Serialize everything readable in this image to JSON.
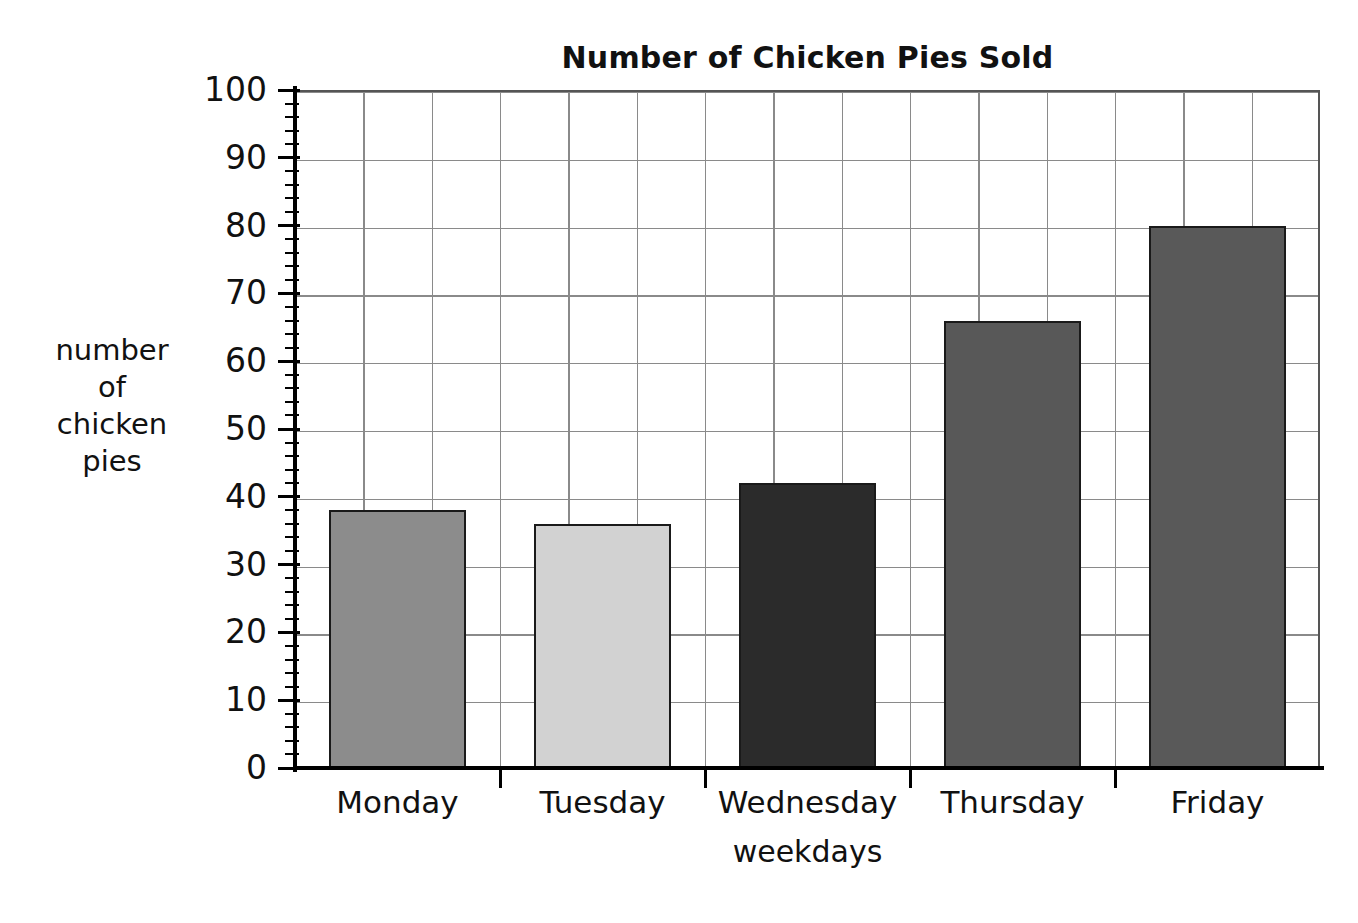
{
  "chart_data": {
    "type": "bar",
    "title": "Number of Chicken Pies Sold",
    "xlabel": "weekdays",
    "ylabel": "number of chicken pies",
    "categories": [
      "Monday",
      "Tuesday",
      "Wednesday",
      "Thursday",
      "Friday"
    ],
    "values": [
      38,
      36,
      42,
      66,
      80
    ],
    "bar_colors": [
      "#8c8c8c",
      "#d2d2d2",
      "#2b2b2b",
      "#585858",
      "#595959"
    ],
    "ylim": [
      0,
      100
    ],
    "ytick_major_step": 10,
    "ytick_minor_step": 2,
    "ytick_labels": [
      "0",
      "10",
      "20",
      "30",
      "40",
      "50",
      "60",
      "70",
      "80",
      "90",
      "100"
    ],
    "grid": true,
    "legend": null
  },
  "axis": {
    "y_caption_lines": [
      "number",
      "of",
      "chicken",
      "pies"
    ]
  }
}
